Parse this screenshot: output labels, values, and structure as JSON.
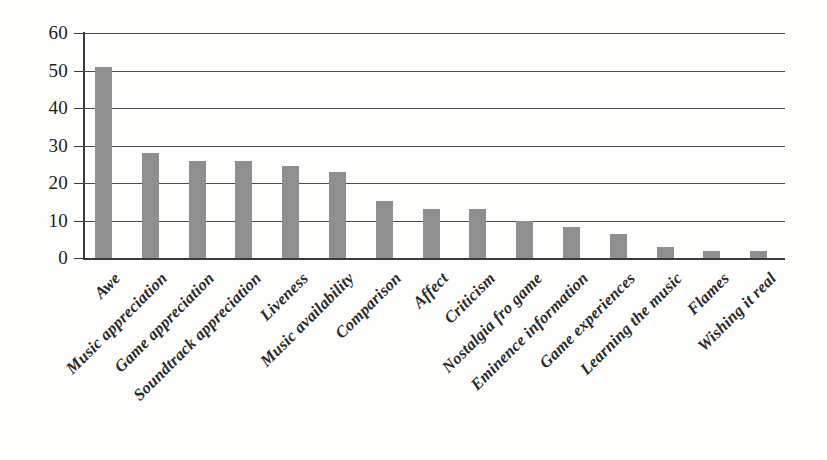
{
  "chart_data": {
    "type": "bar",
    "title": "",
    "subtitle": "",
    "xlabel": "",
    "ylabel": "",
    "ylim": [
      0,
      60
    ],
    "ytick_values": [
      0,
      10,
      20,
      30,
      40,
      50,
      60
    ],
    "ytick_labels": [
      "0",
      "10",
      "20",
      "30",
      "40",
      "50",
      "60"
    ],
    "grid": "horizontal",
    "legend": "none",
    "orientation": "vertical",
    "bar_color": "#8f8f8f",
    "axis_color": "#3a3a3a",
    "background_color": "#fdfdfb",
    "label_rotation": -45,
    "categories": [
      "Awe",
      "Music appreciation",
      "Game appreciation",
      "Soundtrack appreciation",
      "Liveness",
      "Music availability",
      "Comparison",
      "Affect",
      "Criticism",
      "Nostalgia fro game",
      "Eminence information",
      "Game experiences",
      "Learning the music",
      "Flames",
      "Wishing it real"
    ],
    "values": [
      51,
      28,
      26,
      26,
      24.5,
      23,
      15.3,
      13,
      13,
      10,
      8.3,
      6.3,
      3,
      2,
      2
    ]
  }
}
